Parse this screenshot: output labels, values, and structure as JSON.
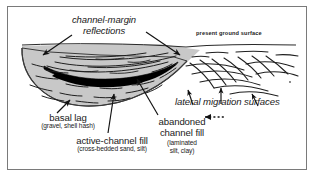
{
  "figure": {
    "domain": "geologic-cross-section-diagram",
    "background_color": "#ffffff",
    "frame_color": "#7a7a7a",
    "ink_color": "#1a1a1a",
    "fill_gray": "#c8c8c8",
    "fill_black": "#000000"
  },
  "labels": {
    "channel_margin_reflections": "channel-margin\nreflections",
    "channel_margin_line1": "channel-margin",
    "channel_margin_line2": "reflections",
    "present_ground_surface": "present ground surface",
    "lateral_migration_surfaces": "lateral migration  surfaces",
    "basal_lag_title": "basal lag",
    "basal_lag_sub": "(gravel, shell hash)",
    "active_channel_title": "active-channel fill",
    "active_channel_sub": "(cross-bedded sand, silt)",
    "abandoned_title_line1": "abandoned",
    "abandoned_title_line2": "channel fill",
    "abandoned_sub_line1": "(laminated",
    "abandoned_sub_line2": "silt, clay)"
  },
  "annotations": {
    "migration_direction_arrow": "dashed-arrow-pointing-left",
    "leader_arrows_count": 7
  }
}
